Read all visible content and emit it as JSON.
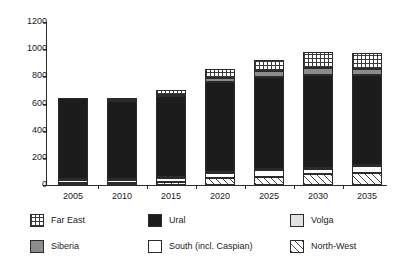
{
  "chart_data": {
    "type": "bar",
    "subtype": "stacked-bar",
    "title": "",
    "xlabel": "",
    "ylabel": "",
    "categories": [
      "2005",
      "2010",
      "2015",
      "2020",
      "2025",
      "2030",
      "2035"
    ],
    "ylim": [
      0,
      1200
    ],
    "yticks": [
      0,
      200,
      400,
      600,
      800,
      1000,
      1200
    ],
    "ytick_labels": [
      "0",
      "200",
      "400",
      "600",
      "800",
      "1000",
      "1200"
    ],
    "grid": false,
    "legend_position": "bottom",
    "stack_order_bottom_to_top": [
      "North-West",
      "South (incl. Caspian)",
      "Volga",
      "Ural",
      "Siberia",
      "Far East"
    ],
    "series": [
      {
        "name": "North-West",
        "pattern": "diagonal-hatch",
        "values": [
          18,
          18,
          25,
          52,
          60,
          80,
          85
        ]
      },
      {
        "name": "South (incl. Caspian)",
        "pattern": "diagonal-crosshatch",
        "values": [
          20,
          20,
          25,
          38,
          50,
          40,
          55
        ]
      },
      {
        "name": "Volga",
        "pattern": "light-solid",
        "values": [
          6,
          6,
          6,
          6,
          8,
          8,
          8
        ]
      },
      {
        "name": "Ural",
        "pattern": "solid-black",
        "values": [
          593,
          575,
          600,
          660,
          680,
          685,
          660
        ]
      },
      {
        "name": "Siberia",
        "pattern": "gray-solid",
        "values": [
          0,
          6,
          10,
          30,
          40,
          45,
          48
        ]
      },
      {
        "name": "Far East",
        "pattern": "grid-crosshatch",
        "values": [
          0,
          18,
          30,
          65,
          80,
          125,
          115
        ]
      }
    ],
    "totals": [
      637,
      643,
      696,
      851,
      918,
      983,
      971
    ]
  },
  "legend": {
    "items": [
      {
        "label": "Far East",
        "series": "Far East"
      },
      {
        "label": "Ural",
        "series": "Ural"
      },
      {
        "label": "Volga",
        "series": "Volga"
      },
      {
        "label": "Siberia",
        "series": "Siberia"
      },
      {
        "label": "South (incl. Caspian)",
        "series": "South (incl. Caspian)"
      },
      {
        "label": "North-West",
        "series": "North-West"
      }
    ]
  },
  "colors": {
    "axis": "#2b2b2b",
    "text": "#1a1a1a",
    "ural": "#1c1c1c",
    "siberia": "#8c8c8c",
    "volga": "#e2e2e2",
    "background": "#ffffff"
  }
}
